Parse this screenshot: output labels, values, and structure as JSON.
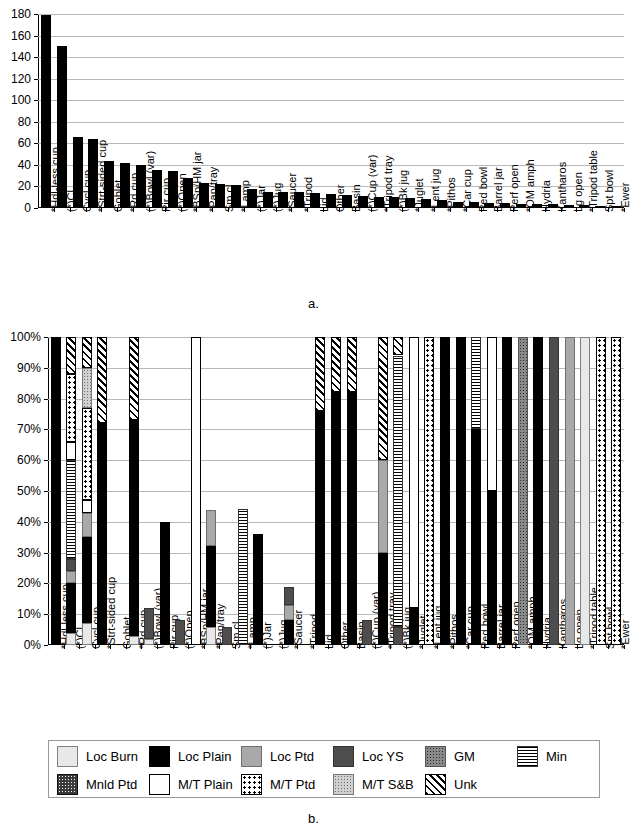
{
  "figure": {
    "panel_a_caption": "a.",
    "panel_b_caption": "b."
  },
  "categories": [
    "*Hdl-less cup",
    "(*)Cl",
    "Cycl cup",
    "*Strt-sided cup",
    "Goblet",
    "*Rd cup",
    "(*)Bowl (var)",
    "Pir cup",
    "(*)Open",
    "*BSp/HM jar",
    "*Pan/tray",
    "Sm cl",
    "*Lamp",
    "(*)Jar",
    "(*)Jug",
    "*Saucer",
    "*Tripod",
    "Lid",
    "Other",
    "Basin",
    "(*)Cup (var)",
    "*Tripod tray",
    "(*)Bk jug",
    "*Juglet",
    "*Lent jug",
    "*Pithos",
    "*Car cup",
    "Ped bowl",
    "Barrel jar",
    "Perf open",
    "*OM amph",
    "Hydria",
    "Kantharos",
    "Lg open",
    "*Tripod table",
    "Spt bowl",
    "*Ewer"
  ],
  "chart_data": [
    {
      "type": "bar",
      "id": "panel-a",
      "title": "",
      "xlabel": "",
      "ylabel": "",
      "ylim": [
        0,
        180
      ],
      "yticks": [
        0,
        20,
        40,
        60,
        80,
        100,
        120,
        140,
        160,
        180
      ],
      "ytick_labels": [
        "0",
        "20",
        "40",
        "60",
        "80",
        "100",
        "120",
        "140",
        "160",
        "180"
      ],
      "grid": true,
      "legend": "none",
      "categories": [
        "*Hdl-less cup",
        "(*)Cl",
        "Cycl cup",
        "*Strt-sided cup",
        "Goblet",
        "*Rd cup",
        "(*)Bowl (var)",
        "Pir cup",
        "(*)Open",
        "*BSp/HM jar",
        "*Pan/tray",
        "Sm cl",
        "*Lamp",
        "(*)Jar",
        "(*)Jug",
        "*Saucer",
        "*Tripod",
        "Lid",
        "Other",
        "Basin",
        "(*)Cup (var)",
        "*Tripod tray",
        "(*)Bk jug",
        "*Juglet",
        "*Lent jug",
        "*Pithos",
        "*Car cup",
        "Ped bowl",
        "Barrel jar",
        "Perf open",
        "*OM amph",
        "Hydria",
        "Kantharos",
        "Lg open",
        "*Tripod table",
        "Spt bowl",
        "*Ewer"
      ],
      "values": [
        179,
        150,
        66,
        64,
        44,
        42,
        40,
        35,
        34,
        28,
        23,
        22,
        21,
        18,
        15,
        15,
        15,
        14,
        13,
        12,
        11,
        10,
        10,
        9,
        8,
        7,
        6,
        6,
        5,
        5,
        4,
        4,
        4,
        3,
        3,
        2,
        2
      ]
    },
    {
      "type": "bar",
      "id": "panel-b",
      "subtype": "stacked-100-percent",
      "title": "",
      "xlabel": "",
      "ylabel": "",
      "ylim": [
        0,
        100
      ],
      "yticks": [
        0,
        10,
        20,
        30,
        40,
        50,
        60,
        70,
        80,
        90,
        100
      ],
      "ytick_labels": [
        "0%",
        "10%",
        "20%",
        "30%",
        "40%",
        "50%",
        "60%",
        "70%",
        "80%",
        "90%",
        "100%"
      ],
      "grid": true,
      "legend": "bottom",
      "categories": [
        "*Hdl-less cup",
        "(*)Cl",
        "Cycl cup",
        "*Strt-sided cup",
        "Goblet",
        "*Rd cup",
        "(*)Bowl (var)",
        "Pir cup",
        "(*)Open",
        "*BSp/HM jar",
        "*Pan/tray",
        "Sm cl",
        "*Lamp",
        "(*)Jar",
        "(*)Jug",
        "*Saucer",
        "*Tripod",
        "Lid",
        "Other",
        "Basin",
        "(*)Cup (var)",
        "*Tripod tray",
        "(*)Bk jug",
        "*Juglet",
        "*Lent jug",
        "*Pithos",
        "*Car cup",
        "Ped bowl",
        "Barrel jar",
        "Perf open",
        "*OM amph",
        "Hydria",
        "Kantharos",
        "Lg open",
        "*Tripod table",
        "Spt bowl",
        "*Ewer"
      ],
      "series": [
        {
          "name": "Loc Burn",
          "key": "locburn",
          "values": [
            0,
            4,
            7,
            0,
            0,
            3,
            2,
            0,
            0,
            0,
            6,
            0,
            0,
            0,
            0,
            0,
            0,
            0,
            0,
            0,
            0,
            0,
            0,
            0,
            0,
            0,
            0,
            0,
            0,
            0,
            0,
            0,
            0,
            0,
            100,
            0,
            0
          ]
        },
        {
          "name": "Loc Plain",
          "key": "locplain",
          "values": [
            100,
            16,
            28,
            72,
            0,
            70,
            0,
            40,
            0,
            0,
            26,
            0,
            0,
            36,
            0,
            8,
            0,
            76,
            82,
            82,
            0,
            30,
            0,
            12,
            0,
            100,
            100,
            70,
            50,
            100,
            0,
            100,
            0,
            0,
            0,
            0,
            0
          ]
        },
        {
          "name": "Loc Ptd",
          "key": "locptd",
          "values": [
            0,
            4,
            8,
            0,
            0,
            0,
            0,
            0,
            0,
            0,
            12,
            0,
            0,
            0,
            0,
            5,
            0,
            0,
            0,
            0,
            0,
            30,
            0,
            0,
            0,
            0,
            0,
            0,
            0,
            0,
            0,
            0,
            0,
            100,
            0,
            0,
            0
          ]
        },
        {
          "name": "Loc YS",
          "key": "locys",
          "values": [
            0,
            4,
            0,
            0,
            0,
            0,
            10,
            0,
            8,
            0,
            0,
            6,
            0,
            0,
            0,
            6,
            0,
            0,
            0,
            0,
            8,
            0,
            6,
            0,
            0,
            0,
            0,
            0,
            0,
            0,
            0,
            0,
            100,
            0,
            0,
            0,
            0
          ]
        },
        {
          "name": "GM",
          "key": "gm",
          "values": [
            0,
            0,
            0,
            0,
            0,
            0,
            0,
            0,
            0,
            0,
            0,
            0,
            0,
            0,
            0,
            0,
            0,
            0,
            0,
            0,
            0,
            0,
            0,
            0,
            0,
            0,
            0,
            0,
            0,
            0,
            100,
            0,
            0,
            0,
            0,
            0,
            0
          ]
        },
        {
          "name": "Min",
          "key": "min",
          "values": [
            0,
            32,
            0,
            0,
            0,
            0,
            0,
            0,
            0,
            0,
            0,
            0,
            44,
            0,
            0,
            0,
            0,
            0,
            0,
            0,
            0,
            0,
            88,
            0,
            0,
            0,
            0,
            30,
            0,
            0,
            0,
            0,
            0,
            0,
            0,
            0,
            0
          ]
        },
        {
          "name": "Mnld Ptd",
          "key": "mnldptd",
          "values": [
            0,
            0,
            0,
            0,
            0,
            0,
            0,
            0,
            0,
            0,
            0,
            0,
            0,
            0,
            0,
            0,
            0,
            0,
            0,
            0,
            0,
            0,
            0,
            0,
            0,
            0,
            0,
            0,
            0,
            0,
            0,
            0,
            0,
            0,
            0,
            0,
            0
          ]
        },
        {
          "name": "M/T Plain",
          "key": "mtplain",
          "values": [
            0,
            6,
            4,
            0,
            0,
            0,
            0,
            0,
            0,
            100,
            0,
            0,
            0,
            0,
            0,
            0,
            0,
            0,
            0,
            0,
            0,
            0,
            0,
            88,
            0,
            0,
            0,
            0,
            50,
            0,
            0,
            0,
            0,
            0,
            0,
            0,
            0
          ]
        },
        {
          "name": "M/T Ptd",
          "key": "mtptd",
          "values": [
            0,
            22,
            30,
            0,
            0,
            0,
            0,
            0,
            0,
            0,
            0,
            0,
            0,
            0,
            0,
            0,
            0,
            0,
            0,
            0,
            0,
            0,
            0,
            0,
            100,
            0,
            0,
            0,
            0,
            0,
            0,
            0,
            0,
            0,
            0,
            100,
            100
          ]
        },
        {
          "name": "M/T S&B",
          "key": "mtsb",
          "values": [
            0,
            0,
            13,
            0,
            0,
            0,
            0,
            0,
            0,
            0,
            0,
            0,
            0,
            0,
            0,
            0,
            0,
            0,
            0,
            0,
            0,
            0,
            0,
            0,
            0,
            0,
            0,
            0,
            0,
            0,
            0,
            0,
            0,
            0,
            0,
            0,
            0
          ]
        },
        {
          "name": "Unk",
          "key": "unk",
          "values": [
            0,
            12,
            10,
            28,
            0,
            27,
            0,
            0,
            0,
            0,
            0,
            0,
            0,
            0,
            0,
            0,
            0,
            24,
            18,
            18,
            0,
            40,
            6,
            0,
            0,
            0,
            0,
            0,
            0,
            0,
            0,
            0,
            0,
            0,
            0,
            0,
            0
          ]
        }
      ]
    }
  ],
  "legend": {
    "row1": [
      {
        "label": "Loc Burn",
        "key": "locburn"
      },
      {
        "label": "Loc Plain",
        "key": "locplain"
      },
      {
        "label": "Loc Ptd",
        "key": "locptd"
      },
      {
        "label": "Loc YS",
        "key": "locys"
      },
      {
        "label": "GM",
        "key": "gm"
      },
      {
        "label": "Min",
        "key": "min"
      }
    ],
    "row2": [
      {
        "label": "Mnld Ptd",
        "key": "mnldptd"
      },
      {
        "label": "M/T Plain",
        "key": "mtplain"
      },
      {
        "label": "M/T Ptd",
        "key": "mtptd"
      },
      {
        "label": "M/T S&B",
        "key": "mtsb"
      },
      {
        "label": "Unk",
        "key": "unk"
      }
    ]
  }
}
